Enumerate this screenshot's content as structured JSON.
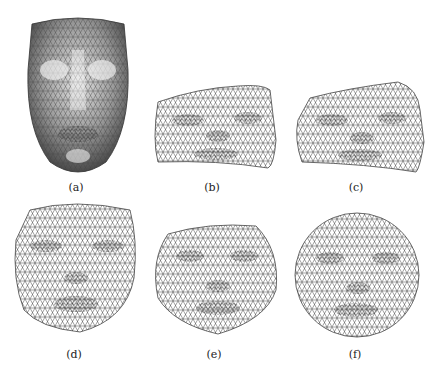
{
  "figure": {
    "panels": [
      {
        "id": "a",
        "label": "(a)",
        "description": "shaded 3D face mesh"
      },
      {
        "id": "b",
        "label": "(b)",
        "description": "flattened wireframe mesh, irregular boundary"
      },
      {
        "id": "c",
        "label": "(c)",
        "description": "flattened wireframe mesh, irregular boundary"
      },
      {
        "id": "d",
        "label": "(d)",
        "description": "flattened wireframe mesh, face-shaped boundary"
      },
      {
        "id": "e",
        "label": "(e)",
        "description": "flattened wireframe mesh, rounded boundary"
      },
      {
        "id": "f",
        "label": "(f)",
        "description": "flattened wireframe mesh, circular boundary"
      }
    ]
  },
  "colors": {
    "mesh_line": "#333333",
    "shaded_face_light": "#d8d8d8",
    "shaded_face_dark": "#555555",
    "background": "#ffffff"
  }
}
